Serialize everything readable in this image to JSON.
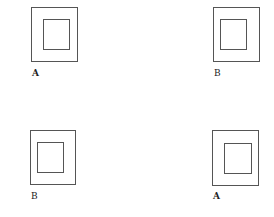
{
  "figures": [
    {
      "label": "A",
      "outer": [
        31,
        7,
        47,
        55
      ],
      "inner": [
        43,
        19,
        27,
        31
      ],
      "label_pos": [
        32,
        68
      ]
    },
    {
      "label": "B",
      "outer": [
        213,
        7,
        47,
        55
      ],
      "inner": [
        220,
        19,
        27,
        31
      ],
      "label_pos": [
        214,
        68
      ]
    },
    {
      "label": "B",
      "outer": [
        30,
        130,
        46,
        55
      ],
      "inner": [
        37,
        142,
        27,
        31
      ],
      "label_pos": [
        31,
        191
      ]
    },
    {
      "label": "A",
      "outer": [
        212,
        130,
        47,
        56
      ],
      "inner": [
        224,
        143,
        28,
        31
      ],
      "label_pos": [
        213,
        191
      ]
    }
  ],
  "colors": {
    "stroke": "#555555",
    "text": "#222222"
  }
}
